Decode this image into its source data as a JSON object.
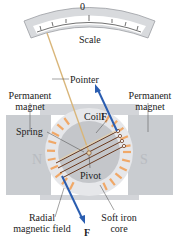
{
  "labels": {
    "scale": "Scale",
    "zero": "0",
    "pointer": "Pointer",
    "magnet_left_1": "Permanent",
    "magnet_left_2": "magnet",
    "magnet_right_1": "Permanent",
    "magnet_right_2": "magnet",
    "coil": "Coil",
    "spring": "Spring",
    "north": "N",
    "south": "S",
    "pivot": "Pivot",
    "radial_1": "Radial",
    "radial_2": "magnetic field",
    "core_1": "Soft iron",
    "core_2": "core",
    "force_top": "F",
    "force_bottom": "F"
  },
  "colors": {
    "magnet": "#c9ccd0",
    "core": "#c4c6ca",
    "field": "#f0a868",
    "force": "#2a5db0",
    "pointer": "#d9b67a",
    "coil": "#6b3a1f"
  }
}
